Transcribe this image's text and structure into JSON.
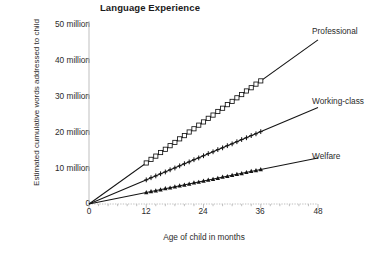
{
  "chart_data": {
    "type": "line",
    "title": "Language Experience",
    "xlabel": "Age of child in months",
    "ylabel": "Estimated cumulative words addressed to child",
    "xlim": [
      0,
      48
    ],
    "ylim": [
      0,
      50
    ],
    "grid": false,
    "legend_position": "right-of-lines",
    "x_ticks": [
      0,
      12,
      24,
      36,
      48
    ],
    "x_tick_labels": [
      "0",
      "12",
      "24",
      "36",
      "48"
    ],
    "y_ticks": [
      0,
      10,
      20,
      30,
      40,
      50
    ],
    "y_tick_labels": [
      "0",
      "10 million",
      "20 million",
      "30 million",
      "40 million",
      "50 million"
    ],
    "units": "million cumulative words",
    "series": [
      {
        "name": "Professional",
        "marker": "open-square",
        "line_from": {
          "x": 0,
          "y": 0
        },
        "line_to": {
          "x": 48,
          "y": 45.6
        },
        "slope_per_month": 0.95,
        "marker_x_start": 12,
        "marker_x_end": 36,
        "marker_count": 25,
        "x": [
          12,
          13,
          14,
          15,
          16,
          17,
          18,
          19,
          20,
          21,
          22,
          23,
          24,
          25,
          26,
          27,
          28,
          29,
          30,
          31,
          32,
          33,
          34,
          35,
          36
        ],
        "values": [
          11.4,
          12.4,
          13.3,
          14.3,
          15.2,
          16.2,
          17.1,
          18.1,
          19.0,
          20.0,
          20.9,
          21.9,
          22.8,
          23.8,
          24.7,
          25.7,
          26.6,
          27.6,
          28.5,
          29.5,
          30.4,
          31.4,
          32.3,
          33.3,
          34.2
        ]
      },
      {
        "name": "Working-class",
        "marker": "cross",
        "line_from": {
          "x": 0,
          "y": 0
        },
        "line_to": {
          "x": 48,
          "y": 26.8
        },
        "slope_per_month": 0.558,
        "marker_x_start": 12,
        "marker_x_end": 36,
        "marker_count": 25,
        "x": [
          12,
          13,
          14,
          15,
          16,
          17,
          18,
          19,
          20,
          21,
          22,
          23,
          24,
          25,
          26,
          27,
          28,
          29,
          30,
          31,
          32,
          33,
          34,
          35,
          36
        ],
        "values": [
          6.7,
          7.3,
          7.8,
          8.4,
          8.9,
          9.5,
          10.0,
          10.6,
          11.2,
          11.7,
          12.3,
          12.8,
          13.4,
          14.0,
          14.5,
          15.1,
          15.6,
          16.2,
          16.7,
          17.3,
          17.9,
          18.4,
          19.0,
          19.5,
          20.1
        ]
      },
      {
        "name": "Welfare",
        "marker": "filled-triangle",
        "line_from": {
          "x": 0,
          "y": 0
        },
        "line_to": {
          "x": 48,
          "y": 12.8
        },
        "slope_per_month": 0.267,
        "marker_x_start": 12,
        "marker_x_end": 36,
        "marker_count": 25,
        "x": [
          12,
          13,
          14,
          15,
          16,
          17,
          18,
          19,
          20,
          21,
          22,
          23,
          24,
          25,
          26,
          27,
          28,
          29,
          30,
          31,
          32,
          33,
          34,
          35,
          36
        ],
        "values": [
          3.2,
          3.5,
          3.7,
          4.0,
          4.3,
          4.5,
          4.8,
          5.1,
          5.3,
          5.6,
          5.9,
          6.1,
          6.4,
          6.7,
          6.9,
          7.2,
          7.5,
          7.7,
          8.0,
          8.3,
          8.5,
          8.8,
          9.1,
          9.3,
          9.6
        ]
      }
    ],
    "colors": {
      "line": "#141414",
      "marker": "#141414",
      "axis": "#b8b8b8",
      "text": "#2b2b2b",
      "background": "#ffffff"
    }
  }
}
